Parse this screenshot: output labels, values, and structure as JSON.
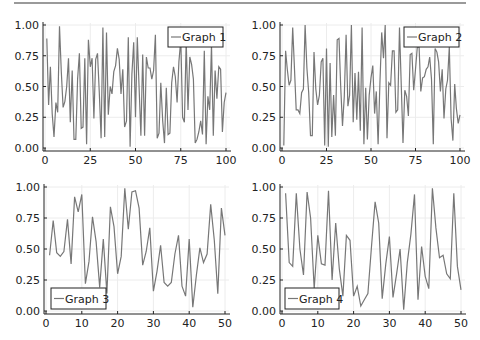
{
  "line_color": "#777777",
  "chart_data": [
    {
      "type": "line",
      "legend": "Graph 1",
      "legend_position": "top-right",
      "xlim": [
        0,
        100
      ],
      "ylim": [
        0,
        1
      ],
      "xticks": [
        "0",
        "25",
        "50",
        "75",
        "100"
      ],
      "yticks": [
        "0.00",
        "0.25",
        "0.50",
        "0.75",
        "1.00"
      ],
      "grid": true,
      "box": {
        "x0": 45,
        "x1": 226,
        "y0": 148,
        "y1": 25
      },
      "legend_box": {
        "x": 168,
        "y": 27,
        "w": 55,
        "h": 20
      },
      "x": [
        1,
        2,
        3,
        4,
        5,
        6,
        7,
        8,
        9,
        10,
        11,
        12,
        13,
        14,
        15,
        16,
        17,
        18,
        19,
        20,
        21,
        22,
        23,
        24,
        25,
        26,
        27,
        28,
        29,
        30,
        31,
        32,
        33,
        34,
        35,
        36,
        37,
        38,
        39,
        40,
        41,
        42,
        43,
        44,
        45,
        46,
        47,
        48,
        49,
        50,
        51,
        52,
        53,
        54,
        55,
        56,
        57,
        58,
        59,
        60,
        61,
        62,
        63,
        64,
        65,
        66,
        67,
        68,
        69,
        70,
        71,
        72,
        73,
        74,
        75,
        76,
        77,
        78,
        79,
        80,
        81,
        82,
        83,
        84,
        85,
        86,
        87,
        88,
        89,
        90,
        91,
        92,
        93,
        94,
        95,
        96,
        97,
        98,
        99,
        100
      ],
      "values": [
        0.89,
        0.35,
        0.66,
        0.28,
        0.09,
        0.37,
        0.29,
        0.99,
        0.62,
        0.33,
        0.38,
        0.5,
        0.73,
        0.21,
        0.63,
        0.07,
        0.07,
        0.56,
        0.77,
        0.16,
        0.17,
        0.73,
        0.03,
        0.88,
        0.66,
        0.73,
        0.24,
        0.72,
        0.77,
        0.45,
        0.08,
        0.98,
        0.09,
        0.94,
        0.27,
        0.5,
        0.44,
        0.62,
        0.67,
        0.81,
        0.72,
        0.44,
        0.64,
        0.17,
        0.22,
        0.9,
        0.01,
        0.6,
        0.86,
        0.25,
        0.9,
        0.49,
        0.1,
        0.76,
        0.1,
        0.74,
        0.65,
        0.65,
        0.56,
        0.63,
        0.92,
        0.08,
        0.12,
        0.53,
        0.22,
        0.04,
        0.49,
        0.11,
        0.12,
        0.53,
        0.66,
        0.58,
        0.37,
        0.7,
        0.88,
        0.25,
        0.21,
        0.87,
        0.31,
        0.74,
        0.68,
        0.56,
        0.04,
        0.07,
        0.13,
        0.22,
        0.11,
        0.79,
        0.03,
        0.42,
        0.31,
        0.84,
        0.1,
        0.63,
        0.4,
        0.66,
        0.64,
        0.13,
        0.37,
        0.45
      ]
    },
    {
      "type": "line",
      "legend": "Graph 2",
      "legend_position": "top-right",
      "xlim": [
        0,
        100
      ],
      "ylim": [
        0,
        1
      ],
      "xticks": [
        "0",
        "25",
        "50",
        "75",
        "100"
      ],
      "yticks": [
        "0.00",
        "0.25",
        "0.50",
        "0.75",
        "1.00"
      ],
      "grid": true,
      "box": {
        "x0": 282,
        "x1": 460,
        "y0": 148,
        "y1": 25
      },
      "legend_box": {
        "x": 404,
        "y": 27,
        "w": 55,
        "h": 20
      },
      "x": [
        1,
        2,
        3,
        4,
        5,
        6,
        7,
        8,
        9,
        10,
        11,
        12,
        13,
        14,
        15,
        16,
        17,
        18,
        19,
        20,
        21,
        22,
        23,
        24,
        25,
        26,
        27,
        28,
        29,
        30,
        31,
        32,
        33,
        34,
        35,
        36,
        37,
        38,
        39,
        40,
        41,
        42,
        43,
        44,
        45,
        46,
        47,
        48,
        49,
        50,
        51,
        52,
        53,
        54,
        55,
        56,
        57,
        58,
        59,
        60,
        61,
        62,
        63,
        64,
        65,
        66,
        67,
        68,
        69,
        70,
        71,
        72,
        73,
        74,
        75,
        76,
        77,
        78,
        79,
        80,
        81,
        82,
        83,
        84,
        85,
        86,
        87,
        88,
        89,
        90,
        91,
        92,
        93,
        94,
        95,
        96,
        97,
        98,
        99,
        100
      ],
      "values": [
        0.02,
        0.79,
        0.64,
        0.51,
        0.55,
        0.98,
        0.64,
        0.31,
        0.31,
        0.28,
        0.45,
        0.48,
        1.0,
        0.65,
        0.45,
        0.1,
        0.1,
        0.78,
        0.48,
        0.35,
        0.43,
        0.7,
        0.73,
        0.02,
        0.81,
        0.01,
        0.69,
        0.09,
        0.43,
        0.1,
        0.88,
        0.89,
        0.5,
        0.18,
        0.42,
        0.92,
        0.34,
        0.43,
        1.0,
        0.21,
        0.61,
        0.23,
        0.62,
        0.14,
        0.98,
        0.03,
        0.49,
        0.07,
        0.43,
        0.57,
        0.67,
        0.28,
        0.46,
        0.03,
        0.52,
        0.94,
        0.73,
        1.0,
        0.08,
        0.53,
        0.51,
        0.79,
        0.79,
        0.29,
        0.31,
        0.98,
        0.5,
        0.04,
        0.47,
        0.42,
        0.26,
        0.76,
        0.77,
        0.47,
        0.64,
        0.82,
        0.82,
        0.46,
        0.57,
        0.58,
        0.64,
        0.66,
        0.74,
        0.56,
        0.03,
        0.81,
        0.78,
        0.7,
        0.46,
        0.64,
        0.24,
        0.48,
        0.55,
        0.82,
        0.24,
        0.06,
        0.52,
        0.32,
        0.2,
        0.27
      ]
    },
    {
      "type": "line",
      "legend": "Graph 3",
      "legend_position": "bottom-left",
      "xlim": [
        0,
        50
      ],
      "ylim": [
        0,
        1
      ],
      "xticks": [
        "0",
        "10",
        "20",
        "30",
        "40",
        "50"
      ],
      "yticks": [
        "0.00",
        "0.25",
        "0.50",
        "0.75",
        "1.00"
      ],
      "grid": true,
      "box": {
        "x0": 46,
        "x1": 225,
        "y0": 311,
        "y1": 187
      },
      "legend_box": {
        "x": 51,
        "y": 288,
        "w": 55,
        "h": 21
      },
      "x": [
        1,
        2,
        3,
        4,
        5,
        6,
        7,
        8,
        9,
        10,
        11,
        12,
        13,
        14,
        15,
        16,
        17,
        18,
        19,
        20,
        21,
        22,
        23,
        24,
        25,
        26,
        27,
        28,
        29,
        30,
        31,
        32,
        33,
        34,
        35,
        36,
        37,
        38,
        39,
        40,
        41,
        42,
        43,
        44,
        45,
        46,
        47,
        48,
        49,
        50
      ],
      "values": [
        0.45,
        0.73,
        0.47,
        0.44,
        0.48,
        0.74,
        0.38,
        0.92,
        0.8,
        0.94,
        0.22,
        0.4,
        0.76,
        0.56,
        0.19,
        0.58,
        0.14,
        0.84,
        0.68,
        0.3,
        0.44,
        0.99,
        0.66,
        0.96,
        0.97,
        0.83,
        0.37,
        0.48,
        0.67,
        0.16,
        0.32,
        0.53,
        0.23,
        0.2,
        0.23,
        0.46,
        0.61,
        0.2,
        0.12,
        0.58,
        0.03,
        0.29,
        0.51,
        0.39,
        0.46,
        0.86,
        0.57,
        0.14,
        0.83,
        0.61
      ]
    },
    {
      "type": "line",
      "legend": "Graph 4",
      "legend_position": "bottom-left",
      "xlim": [
        0,
        50
      ],
      "ylim": [
        0,
        1
      ],
      "xticks": [
        "0",
        "10",
        "20",
        "30",
        "40",
        "50"
      ],
      "yticks": [
        "0.00",
        "0.25",
        "0.50",
        "0.75",
        "1.00"
      ],
      "grid": true,
      "box": {
        "x0": 282,
        "x1": 461,
        "y0": 311,
        "y1": 187
      },
      "legend_box": {
        "x": 285,
        "y": 288,
        "w": 54,
        "h": 21
      },
      "x": [
        1,
        2,
        3,
        4,
        5,
        6,
        7,
        8,
        9,
        10,
        11,
        12,
        13,
        14,
        15,
        16,
        17,
        18,
        19,
        20,
        21,
        22,
        23,
        24,
        25,
        26,
        27,
        28,
        29,
        30,
        31,
        32,
        33,
        34,
        35,
        36,
        37,
        38,
        39,
        40,
        41,
        42,
        43,
        44,
        45,
        46,
        47,
        48,
        49,
        50
      ],
      "values": [
        0.95,
        0.39,
        0.36,
        0.95,
        0.5,
        0.29,
        0.96,
        0.75,
        0.18,
        0.61,
        0.38,
        0.37,
        0.97,
        0.25,
        0.71,
        0.34,
        0.12,
        0.61,
        0.57,
        0.12,
        0.2,
        0.04,
        0.09,
        0.14,
        0.52,
        0.88,
        0.71,
        0.1,
        0.38,
        0.6,
        0.11,
        0.3,
        0.5,
        0.01,
        0.39,
        0.62,
        0.94,
        0.09,
        0.52,
        0.28,
        0.18,
        0.99,
        0.67,
        0.43,
        0.45,
        0.3,
        0.26,
        0.95,
        0.36,
        0.17
      ]
    }
  ]
}
